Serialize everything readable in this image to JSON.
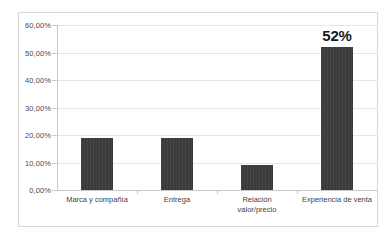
{
  "chart_data": {
    "type": "bar",
    "title": "",
    "subtitle": "",
    "xlabel": "",
    "ylabel": "",
    "categories": [
      "Marca y compañía",
      "Entrega",
      "Relación\nvalor/precio",
      "Experiencia de venta"
    ],
    "values": [
      19,
      19,
      9,
      52
    ],
    "ylim": [
      0,
      60
    ],
    "ytick_step": 10,
    "ytick_labels": [
      "0,00%",
      "10,00%",
      "20,00%",
      "30,00%",
      "40,00%",
      "50,00%",
      "60,00%"
    ],
    "ytick_values": [
      0,
      10,
      20,
      30,
      40,
      50,
      60
    ],
    "grid": true,
    "legend": false,
    "legend_position": "none",
    "data_labels": [
      "",
      "",
      "",
      "52%"
    ],
    "series": [
      {
        "name": "",
        "values": [
          19,
          19,
          9,
          52
        ]
      }
    ]
  },
  "style": {
    "bar_color": "#3b3b3b",
    "gridline_color": "#e6e6e6",
    "axis_color": "#c9c9c9",
    "frame_color": "#d8d8d8",
    "background": "#ffffff",
    "tick_text_color": "#4a4a4a",
    "category_text_color": "#3f3f3f",
    "data_label_color": "#1a1a1a"
  }
}
